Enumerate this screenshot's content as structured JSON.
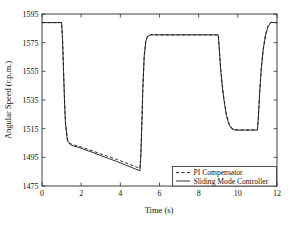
{
  "chart_data": {
    "type": "line",
    "title": "",
    "xlabel": "Time (s)",
    "ylabel": "Angular Speed (r.p.m.)",
    "xlim": [
      0,
      12
    ],
    "ylim": [
      1475,
      1595
    ],
    "xticks": [
      0,
      2,
      4,
      6,
      8,
      10,
      12
    ],
    "yticks": [
      1475,
      1495,
      1515,
      1535,
      1555,
      1575,
      1595
    ],
    "xtick_labels": [
      "0",
      "2",
      "4",
      "6",
      "8",
      "10",
      "12"
    ],
    "ytick_labels": [
      "1475",
      "1495",
      "1515",
      "1535",
      "1555",
      "1575",
      "1595"
    ],
    "grid": false,
    "legend_position": "lower right",
    "legend": [
      {
        "name": "PI Compensator",
        "style": "dashed"
      },
      {
        "name": "Sliding Mode Controller",
        "style": "solid"
      }
    ],
    "series": [
      {
        "name": "PI Compensator",
        "style": "dashed",
        "x": [
          0.0,
          0.3,
          0.6,
          0.9,
          1.0,
          1.05,
          1.1,
          1.15,
          1.2,
          1.3,
          1.45,
          1.6,
          1.8,
          2.0,
          2.3,
          2.6,
          3.0,
          3.4,
          3.8,
          4.2,
          4.6,
          4.9,
          5.0,
          5.05,
          5.1,
          5.15,
          5.22,
          5.3,
          5.4,
          5.55,
          5.75,
          6.0,
          6.5,
          7.0,
          7.5,
          8.0,
          8.5,
          8.9,
          9.0,
          9.05,
          9.12,
          9.2,
          9.3,
          9.42,
          9.55,
          9.7,
          9.85,
          10.0,
          10.4,
          10.8,
          11.0,
          11.05,
          11.12,
          11.2,
          11.3,
          11.42,
          11.55,
          11.7,
          11.85,
          12.0
        ],
        "y": [
          1589.0,
          1589.0,
          1589.0,
          1589.0,
          1589.0,
          1578.0,
          1556.0,
          1535.0,
          1519.0,
          1507.5,
          1504.5,
          1503.8,
          1503.0,
          1502.2,
          1500.8,
          1499.4,
          1497.4,
          1495.5,
          1493.6,
          1491.6,
          1489.4,
          1487.8,
          1487.2,
          1498.0,
          1520.0,
          1544.0,
          1566.0,
          1576.5,
          1579.8,
          1580.6,
          1580.6,
          1580.5,
          1580.5,
          1580.5,
          1580.5,
          1580.5,
          1580.5,
          1580.5,
          1580.5,
          1572.0,
          1558.0,
          1546.0,
          1535.0,
          1525.0,
          1518.5,
          1515.2,
          1514.3,
          1514.2,
          1514.2,
          1514.2,
          1514.2,
          1524.0,
          1542.0,
          1558.0,
          1571.0,
          1581.0,
          1586.8,
          1589.3,
          1589.2,
          1589.0
        ]
      },
      {
        "name": "Sliding Mode Controller",
        "style": "solid",
        "x": [
          0.0,
          0.3,
          0.6,
          0.9,
          1.0,
          1.05,
          1.1,
          1.15,
          1.2,
          1.3,
          1.45,
          1.6,
          1.8,
          2.0,
          2.3,
          2.6,
          3.0,
          3.4,
          3.8,
          4.2,
          4.6,
          4.9,
          5.0,
          5.05,
          5.1,
          5.15,
          5.22,
          5.3,
          5.4,
          5.55,
          5.75,
          6.0,
          6.5,
          7.0,
          7.5,
          8.0,
          8.5,
          8.9,
          9.0,
          9.05,
          9.12,
          9.2,
          9.3,
          9.42,
          9.55,
          9.7,
          9.85,
          10.0,
          10.4,
          10.8,
          11.0,
          11.05,
          11.12,
          11.2,
          11.3,
          11.42,
          11.55,
          11.7,
          11.85,
          12.0
        ],
        "y": [
          1589.0,
          1589.0,
          1589.0,
          1589.0,
          1589.0,
          1577.0,
          1555.0,
          1534.0,
          1518.0,
          1506.5,
          1503.8,
          1503.0,
          1502.2,
          1501.4,
          1499.8,
          1498.4,
          1496.2,
          1494.2,
          1492.2,
          1490.0,
          1487.8,
          1486.2,
          1485.6,
          1497.0,
          1519.0,
          1543.0,
          1565.5,
          1576.0,
          1579.5,
          1580.4,
          1580.4,
          1580.4,
          1580.4,
          1580.4,
          1580.4,
          1580.4,
          1580.4,
          1580.4,
          1580.4,
          1571.0,
          1557.0,
          1545.0,
          1534.0,
          1524.0,
          1517.8,
          1514.8,
          1514.1,
          1514.0,
          1514.0,
          1514.0,
          1514.0,
          1523.0,
          1541.0,
          1557.0,
          1570.5,
          1580.5,
          1586.5,
          1589.1,
          1589.0,
          1588.9
        ]
      }
    ]
  },
  "colors": {
    "line": "#1a1a1a",
    "axis": "#2b2b2b",
    "background": "#ffffff"
  }
}
